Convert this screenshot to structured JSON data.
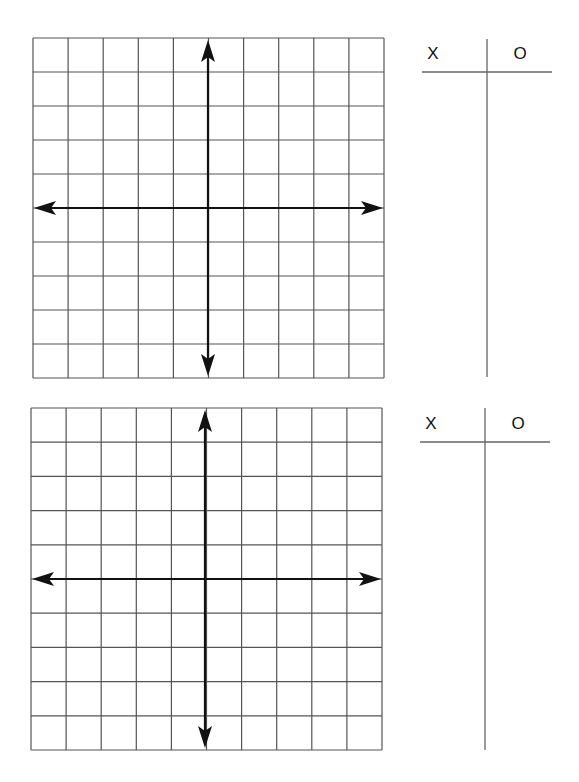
{
  "worksheet": {
    "panels": [
      {
        "grid": {
          "left": 33,
          "top": 38,
          "right": 384,
          "bottom": 378,
          "cols": 10,
          "rows": 10,
          "axis_x_pos": 208,
          "axis_y_pos": 208
        },
        "table": {
          "col1_header": "X",
          "col2_header": "O",
          "hline_y": 72,
          "hline_x1": 422,
          "hline_x2": 552,
          "vline_x": 487,
          "vline_y1": 39,
          "vline_y2": 377
        }
      },
      {
        "grid": {
          "left": 31,
          "top": 408,
          "right": 382,
          "bottom": 750,
          "cols": 10,
          "rows": 10,
          "axis_x_pos": 205,
          "axis_y_pos": 579
        },
        "table": {
          "col1_header": "X",
          "col2_header": "O",
          "hline_y": 442,
          "hline_x1": 420,
          "hline_x2": 550,
          "vline_x": 485,
          "vline_y1": 408,
          "vline_y2": 750
        }
      }
    ],
    "colors": {
      "grid_line": "#555555",
      "axis": "#111111",
      "table_line": "#666666"
    }
  }
}
